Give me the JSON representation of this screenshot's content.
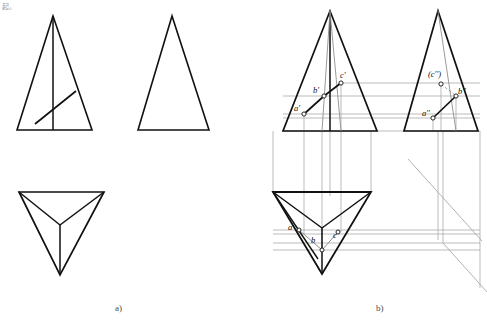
{
  "page": {
    "width": 487,
    "height": 324,
    "background": "#ffffff",
    "corner_mark": "起。",
    "line_color_solid": "#111111",
    "line_color_thin": "#8e8e8e",
    "line_color_projection": "#a9a9a9"
  },
  "captions": {
    "part_a": "a)",
    "part_b": "b)"
  },
  "figure": {
    "title_a": "a)",
    "title_b": "b)"
  },
  "part_a": {
    "views": [
      {
        "name": "front-view-with-line",
        "shape": "triangle",
        "apex": [
          53,
          16
        ],
        "base_left": [
          17,
          130
        ],
        "base_right": [
          92,
          130
        ],
        "center_line": [
          [
            53,
            16
          ],
          [
            53,
            130
          ]
        ],
        "surface_line": [
          [
            35,
            124
          ],
          [
            76,
            91
          ]
        ]
      },
      {
        "name": "side-view",
        "shape": "triangle",
        "apex": [
          172,
          16
        ],
        "base_left": [
          138,
          130
        ],
        "base_right": [
          209,
          130
        ]
      },
      {
        "name": "top-view",
        "shape": "inverted-triangle",
        "top_left": [
          19,
          192
        ],
        "top_right": [
          104,
          192
        ],
        "bottom": [
          60,
          275
        ],
        "center": [
          60,
          225
        ]
      }
    ]
  },
  "part_b": {
    "views": [
      {
        "name": "front-view-projection",
        "shape": "triangle",
        "apex": [
          330,
          11
        ],
        "base_left": [
          283,
          131
        ],
        "base_right": [
          377,
          131
        ],
        "labels": [
          "a'",
          "b'",
          "c'"
        ]
      },
      {
        "name": "side-view-projection",
        "shape": "triangle",
        "apex": [
          438,
          11
        ],
        "base_left": [
          404,
          131
        ],
        "base_right": [
          478,
          131
        ],
        "labels": [
          "a''",
          "b''",
          "(c'')"
        ]
      },
      {
        "name": "top-view-projection",
        "shape": "inverted-triangle",
        "top_left": [
          273,
          192
        ],
        "top_right": [
          371,
          192
        ],
        "bottom": [
          322,
          274
        ],
        "labels": [
          "a",
          "b",
          "c"
        ]
      }
    ],
    "mitre_line": [
      [
        408,
        159
      ],
      [
        480,
        240
      ]
    ],
    "point_labels": {
      "front": [
        {
          "text": "a'",
          "x": 296,
          "y": 108,
          "dot_x": 304,
          "dot_y": 114
        },
        {
          "text": "b'",
          "x": 314,
          "y": 90,
          "dot_x": 324,
          "dot_y": 96
        },
        {
          "text": "c'",
          "x": 341,
          "y": 76,
          "dot_x": 341,
          "dot_y": 83
        }
      ],
      "side": [
        {
          "text": "a''",
          "x": 425,
          "y": 113,
          "dot_x": 433,
          "dot_y": 118
        },
        {
          "text": "b''",
          "x": 459,
          "y": 92,
          "dot_x": 456,
          "dot_y": 96
        },
        {
          "text": "(c'')",
          "x": 430,
          "y": 74,
          "dot_x": 441,
          "dot_y": 84
        }
      ],
      "top": [
        {
          "text": "a",
          "x": 290,
          "y": 227,
          "dot_x": 299,
          "dot_y": 230
        },
        {
          "text": "b",
          "x": 313,
          "y": 240,
          "dot_x": 322,
          "dot_y": 243
        },
        {
          "text": "c",
          "x": 334,
          "y": 235,
          "dot_x": 338,
          "dot_y": 232
        }
      ]
    }
  }
}
